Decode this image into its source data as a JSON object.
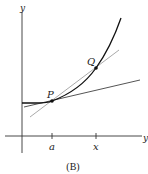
{
  "figure": {
    "caption": "(B)",
    "axes": {
      "y_label": "y",
      "x_label": "y"
    },
    "ticks": [
      {
        "label": "a",
        "x": 52
      },
      {
        "label": "x",
        "x": 96
      }
    ],
    "points": [
      {
        "label": "P",
        "x": 52,
        "y": 101
      },
      {
        "label": "Q",
        "x": 96,
        "y": 68
      }
    ],
    "curves": {
      "function": "increasing convex curve",
      "tangent_line": "tangent at P",
      "secant_line": "secant through P and Q"
    },
    "colors": {
      "curve": "#111111",
      "tangent": "#555555",
      "secant": "#aaaaaa",
      "axes": "#333333"
    }
  }
}
